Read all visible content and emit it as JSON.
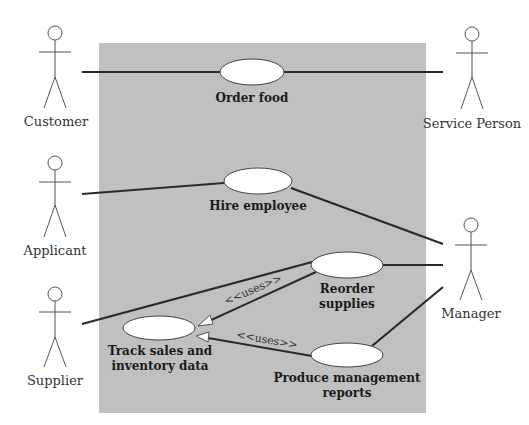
{
  "diagram": {
    "type": "use-case",
    "system_boundary_color": "#c0c0c0",
    "actors": [
      {
        "id": "customer",
        "label": "Customer"
      },
      {
        "id": "service_person",
        "label": "Service Person"
      },
      {
        "id": "applicant",
        "label": "Applicant"
      },
      {
        "id": "supplier",
        "label": "Supplier"
      },
      {
        "id": "manager",
        "label": "Manager"
      }
    ],
    "use_cases": [
      {
        "id": "order_food",
        "lines": [
          "Order food"
        ]
      },
      {
        "id": "hire_employee",
        "lines": [
          "Hire employee"
        ]
      },
      {
        "id": "reorder_supplies",
        "lines": [
          "Reorder",
          "supplies"
        ]
      },
      {
        "id": "track_sales",
        "lines": [
          "Track sales and",
          "inventory data"
        ]
      },
      {
        "id": "produce_reports",
        "lines": [
          "Produce management",
          "reports"
        ]
      }
    ],
    "associations": [
      {
        "from": "customer",
        "to": "order_food"
      },
      {
        "from": "service_person",
        "to": "order_food"
      },
      {
        "from": "applicant",
        "to": "hire_employee"
      },
      {
        "from": "manager",
        "to": "hire_employee"
      },
      {
        "from": "manager",
        "to": "reorder_supplies"
      },
      {
        "from": "manager",
        "to": "produce_reports"
      },
      {
        "from": "supplier",
        "to": "reorder_supplies"
      }
    ],
    "uses": [
      {
        "from": "reorder_supplies",
        "to": "track_sales",
        "label": "<<uses>>"
      },
      {
        "from": "produce_reports",
        "to": "track_sales",
        "label": "<<uses>>"
      }
    ]
  }
}
